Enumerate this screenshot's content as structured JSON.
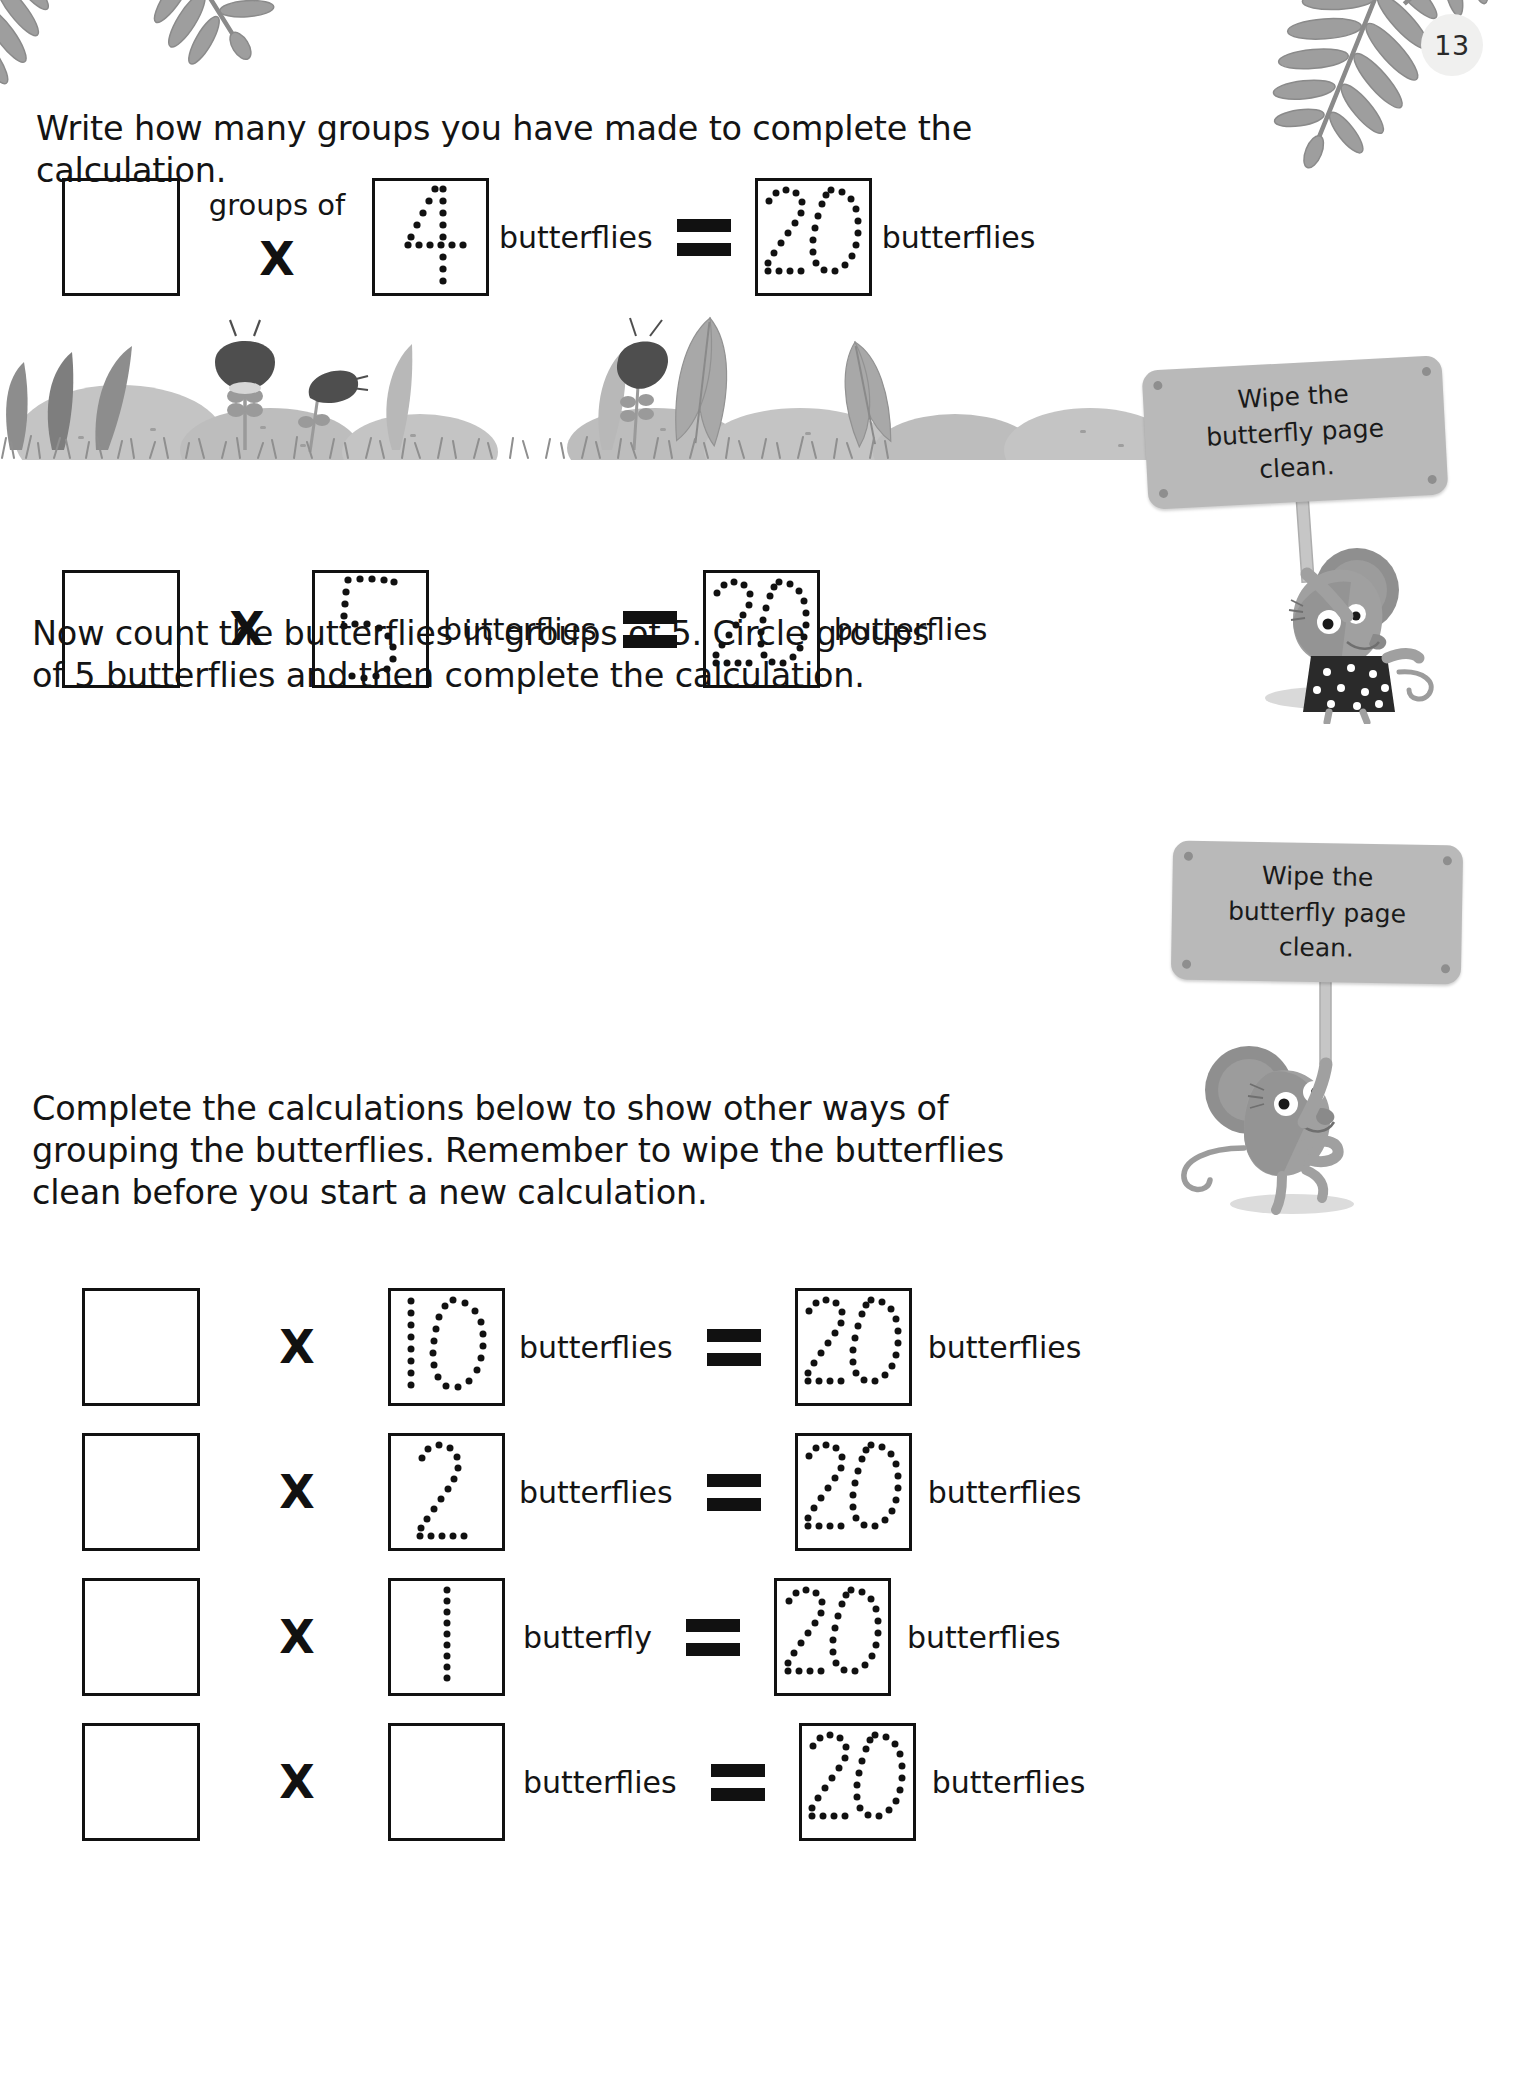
{
  "page": {
    "number": "13",
    "background_color": "#ffffff",
    "ink_color": "#141414",
    "sign_color": "#b9b9b9",
    "foliage_color": "#b0b0b0"
  },
  "instructions": [
    {
      "id": "instruction-1",
      "text": "Write how many groups you have made to complete the calculation."
    },
    {
      "id": "instruction-2",
      "text": "Now count the butterflies in groups of 5. Circle groups\nof 5 butterflies and then complete the calculation."
    },
    {
      "id": "instruction-3",
      "text": "Complete the calculations below to show other ways of\ngrouping the butterflies. Remember to wipe the butterflies\nclean before you start a new calculation."
    }
  ],
  "calculations": [
    {
      "id": "calc-row-1",
      "answer_box_value": "",
      "groups_of_label": "groups of",
      "multiply_symbol": "X",
      "multiplicand_traced": "4",
      "multiplicand_unit": "butterflies",
      "equals_symbol": "=",
      "product_traced": "20",
      "product_unit": "butterflies"
    },
    {
      "id": "calc-row-2",
      "answer_box_value": "",
      "groups_of_label": "",
      "multiply_symbol": "X",
      "multiplicand_traced": "5",
      "multiplicand_unit": "butterflies",
      "equals_symbol": "=",
      "product_traced": "20",
      "product_unit": "butterflies"
    },
    {
      "id": "calc-row-3",
      "answer_box_value": "",
      "groups_of_label": "",
      "multiply_symbol": "X",
      "multiplicand_traced": "10",
      "multiplicand_unit": "butterflies",
      "equals_symbol": "=",
      "product_traced": "20",
      "product_unit": "butterflies"
    },
    {
      "id": "calc-row-4",
      "answer_box_value": "",
      "groups_of_label": "",
      "multiply_symbol": "X",
      "multiplicand_traced": "2",
      "multiplicand_unit": "butterflies",
      "equals_symbol": "=",
      "product_traced": "20",
      "product_unit": "butterflies"
    },
    {
      "id": "calc-row-5",
      "answer_box_value": "",
      "groups_of_label": "",
      "multiply_symbol": "X",
      "multiplicand_traced": "1",
      "multiplicand_unit": "butterfly",
      "equals_symbol": "=",
      "product_traced": "20",
      "product_unit": "butterflies"
    },
    {
      "id": "calc-row-6",
      "answer_box_value": "",
      "groups_of_label": "",
      "multiply_symbol": "X",
      "multiplicand_traced": "",
      "multiplicand_unit": "butterflies",
      "equals_symbol": "=",
      "product_traced": "20",
      "product_unit": "butterflies"
    }
  ],
  "signs": [
    {
      "id": "sign-1",
      "line1": "Wipe the",
      "line2": "butterfly page",
      "line3": "clean."
    },
    {
      "id": "sign-2",
      "line1": "Wipe the",
      "line2": "butterfly page",
      "line3": "clean."
    }
  ],
  "decorations": {
    "fern_top_left": "fern-leaf-icon",
    "fern_top_right": "fern-leaf-icon",
    "garden_scene": "garden-scene-illustration",
    "mouse_1": "mouse-character-icon",
    "mouse_2": "mouse-character-icon"
  }
}
